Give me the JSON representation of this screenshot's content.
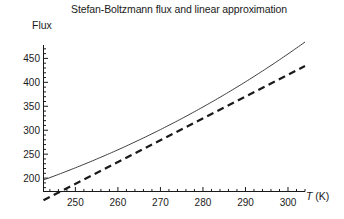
{
  "chart_data": {
    "type": "line",
    "title": "Stefan-Boltzmann flux and linear approximation",
    "xlabel": "T (K)",
    "xlabel_symbol": "T",
    "xlabel_unit": "(K)",
    "ylabel": "Flux",
    "xlim": [
      242.5,
      304.0
    ],
    "ylim": [
      172.0,
      478.0
    ],
    "xticks": [
      250,
      260,
      270,
      280,
      290,
      300
    ],
    "xtick_labels": [
      "250",
      "260",
      "270",
      "280",
      "290",
      "300"
    ],
    "yticks": [
      200,
      250,
      300,
      350,
      400,
      450
    ],
    "ytick_labels": [
      "200",
      "250",
      "300",
      "350",
      "400",
      "450"
    ],
    "xminor_step": 2,
    "yminor_step": 10,
    "grid": false,
    "legend": "none",
    "series": [
      {
        "name": "Stefan-Boltzmann flux",
        "style": "solid",
        "color": "#3d3d3d",
        "width": 1.0,
        "formula": "sigma*T^4",
        "sigma": 5.67e-08,
        "x": [
          243,
          246,
          249,
          252,
          255,
          258,
          261,
          264,
          267,
          270,
          273,
          276,
          279,
          282,
          285,
          288,
          291,
          294,
          297,
          300,
          303
        ],
        "y": [
          197.8,
          206.0,
          214.6,
          223.4,
          232.6,
          242.2,
          252.0,
          262.3,
          272.9,
          283.9,
          295.2,
          307.0,
          319.1,
          331.6,
          344.6,
          358.0,
          371.8,
          386.0,
          400.7,
          415.9,
          431.5
        ]
      },
      {
        "name": "linear approximation",
        "style": "dashed",
        "color": "#1a1a1a",
        "width": 2.2,
        "formula": "4*sigma*T0^3*(T-T0) + sigma*T0^4",
        "tangent_point_K": 272,
        "slope": 4.56,
        "intercept": -952.0,
        "x": [
          243,
          303
        ],
        "y": [
          156.1,
          429.7
        ]
      }
    ]
  },
  "axes": {
    "x_axis_name": "horizontal-axis",
    "y_axis_name": "vertical-axis"
  }
}
